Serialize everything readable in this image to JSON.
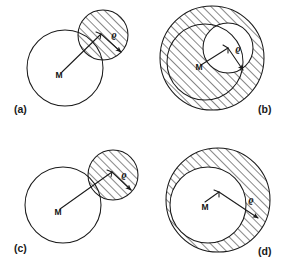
{
  "figure": {
    "stroke_color": "#1a1a1a",
    "background_color": "#ffffff",
    "hatch_color": "#1a1a1a",
    "width": 290,
    "height": 273,
    "panels": [
      {
        "id": "a",
        "label": "(a)",
        "label_x": 14,
        "label_y": 113,
        "description": "Large open circle centred at M overlapped at upper right by a smaller hatched disc; radius arrow labelled rho inside the hatched disc.",
        "center_label": "M",
        "radius_label": "ϱ",
        "big_circle": {
          "cx": 65,
          "cy": 68,
          "r": 38,
          "hatched": false
        },
        "small_circle": {
          "cx": 103,
          "cy": 35,
          "r": 25,
          "hatched": true
        },
        "m_label_x": 59,
        "m_label_y": 78,
        "rho_label_x": 114,
        "rho_label_y": 38,
        "leader_from": [
          62,
          72
        ],
        "leader_to": [
          101,
          34
        ],
        "arrow_from": [
          101,
          34
        ],
        "arrow_to": [
          121,
          52
        ]
      },
      {
        "id": "b",
        "label": "(b)",
        "label_x": 258,
        "label_y": 113,
        "description": "Large hatched disc containing an open circle centred at M; a smaller white disc of radius rho sits inside at the upper right, punched out of the hatching.",
        "center_label": "M",
        "radius_label": "ϱ",
        "outer_circle": {
          "cx": 212,
          "cy": 58,
          "r": 52,
          "hatched": true
        },
        "big_circle": {
          "cx": 205,
          "cy": 62,
          "r": 38,
          "hatched": true
        },
        "small_circle": {
          "cx": 228,
          "cy": 48,
          "r": 25,
          "hatched": false
        },
        "m_label_x": 199,
        "m_label_y": 70,
        "rho_label_x": 238,
        "rho_label_y": 52,
        "leader_from": [
          201,
          65
        ],
        "leader_to": [
          228,
          48
        ],
        "arrow_from": [
          228,
          48
        ],
        "arrow_to": [
          243,
          70
        ]
      },
      {
        "id": "c",
        "label": "(c)",
        "label_x": 14,
        "label_y": 252,
        "description": "Large open circle centred at M externally tangent to a smaller hatched disc at the upper right; radius arrow labelled rho inside the hatched disc.",
        "center_label": "M",
        "radius_label": "ϱ",
        "big_circle": {
          "cx": 63,
          "cy": 205,
          "r": 38,
          "hatched": false
        },
        "small_circle": {
          "cx": 113,
          "cy": 175,
          "r": 25,
          "hatched": true
        },
        "m_label_x": 58,
        "m_label_y": 215,
        "rho_label_x": 124,
        "rho_label_y": 178,
        "leader_from": [
          60,
          209
        ],
        "leader_to": [
          112,
          172
        ],
        "arrow_from": [
          112,
          172
        ],
        "arrow_to": [
          131,
          190
        ]
      },
      {
        "id": "d",
        "label": "(d)",
        "label_x": 258,
        "label_y": 255,
        "description": "Hatched annulus between an outer circle and an inner open circle centred at M; arrow of length rho runs from near M out to the outer circle.",
        "center_label": "M",
        "radius_label": "ϱ",
        "outer_circle": {
          "cx": 218,
          "cy": 200,
          "r": 52,
          "hatched": true
        },
        "big_circle": {
          "cx": 208,
          "cy": 205,
          "r": 38,
          "hatched": false
        },
        "m_label_x": 205,
        "m_label_y": 210,
        "rho_label_x": 251,
        "rho_label_y": 203,
        "leader_from": [
          205,
          202
        ],
        "leader_to": [
          219,
          192
        ],
        "arrow_from": [
          219,
          192
        ],
        "arrow_to": [
          258,
          218
        ]
      }
    ]
  }
}
